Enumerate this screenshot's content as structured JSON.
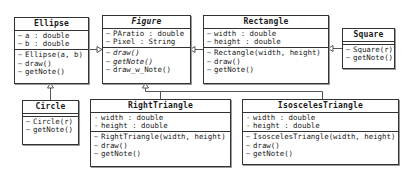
{
  "diagram": {
    "type": "uml-class-diagram",
    "classes": {
      "ellipse": {
        "name": "Ellipse",
        "attributes": [
          {
            "vis": "~",
            "text": "a : double"
          },
          {
            "vis": "~",
            "text": "b : double"
          }
        ],
        "methods": [
          {
            "vis": "~",
            "text": "Ellipse(a, b)"
          },
          {
            "vis": "~",
            "text": "draw()"
          },
          {
            "vis": "~",
            "text": "getNote()"
          }
        ]
      },
      "figure": {
        "name": "Figure",
        "abstract": true,
        "attributes": [
          {
            "vis": "~",
            "text": "PAratio : double"
          },
          {
            "vis": "~",
            "text": "Pixel : String"
          }
        ],
        "methods": [
          {
            "vis": "~",
            "text": "draw()",
            "abstract": true
          },
          {
            "vis": "~",
            "text": "getNote()",
            "abstract": true
          },
          {
            "vis": "~",
            "text": "draw_w_Note()"
          }
        ]
      },
      "rectangle": {
        "name": "Rectangle",
        "attributes": [
          {
            "vis": "~",
            "text": "width : double"
          },
          {
            "vis": "~",
            "text": "height : double"
          }
        ],
        "methods": [
          {
            "vis": "~",
            "text": "Rectangle(width, height)"
          },
          {
            "vis": "~",
            "text": "draw()"
          },
          {
            "vis": "~",
            "text": "getNote()"
          }
        ]
      },
      "square": {
        "name": "Square",
        "attributes": [],
        "methods": [
          {
            "vis": "~",
            "text": "Square(r)"
          },
          {
            "vis": "~",
            "text": "getNote()"
          }
        ]
      },
      "circle": {
        "name": "Circle",
        "attributes": [],
        "methods": [
          {
            "vis": "~",
            "text": "Circle(r)"
          },
          {
            "vis": "~",
            "text": "getNote()"
          }
        ]
      },
      "right_triangle": {
        "name": "RightTriangle",
        "attributes": [
          {
            "vis": "-",
            "text": "width : double"
          },
          {
            "vis": "-",
            "text": "height : double"
          }
        ],
        "methods": [
          {
            "vis": "~",
            "text": "RightTriangle(width, height)"
          },
          {
            "vis": "~",
            "text": "draw()"
          },
          {
            "vis": "~",
            "text": "getNote()"
          }
        ]
      },
      "isosceles_triangle": {
        "name": "IsoscelesTriangle",
        "attributes": [
          {
            "vis": "-",
            "text": "width : double"
          },
          {
            "vis": "-",
            "text": "height : double"
          }
        ],
        "methods": [
          {
            "vis": "~",
            "text": "IsoscelesTriangle(width, height)"
          },
          {
            "vis": "~",
            "text": "draw()"
          },
          {
            "vis": "~",
            "text": "getNote()"
          }
        ]
      }
    },
    "relations": [
      {
        "kind": "generalization",
        "from": "Ellipse",
        "to": "Figure"
      },
      {
        "kind": "generalization",
        "from": "Rectangle",
        "to": "Figure"
      },
      {
        "kind": "generalization",
        "from": "Square",
        "to": "Rectangle"
      },
      {
        "kind": "generalization",
        "from": "Circle",
        "to": "Ellipse"
      },
      {
        "kind": "generalization",
        "from": "RightTriangle",
        "to": "Figure"
      },
      {
        "kind": "generalization",
        "from": "IsoscelesTriangle",
        "to": "Figure"
      }
    ],
    "colors": {
      "line": "#333333",
      "background": "#ffffff"
    }
  }
}
